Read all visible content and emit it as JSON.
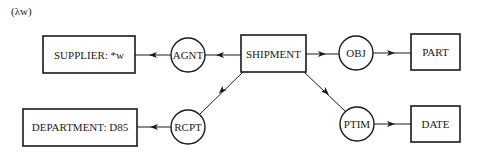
{
  "header": {
    "lambda_label": "(λw)"
  },
  "concepts": {
    "supplier": "SUPPLIER:  *w",
    "shipment": "SHIPMENT",
    "part": "PART",
    "department": "DEPARTMENT:  D85",
    "date": "DATE"
  },
  "relations": {
    "agnt": "AGNT",
    "obj": "OBJ",
    "rcpt": "RCPT",
    "ptim": "PTIM"
  },
  "colors": {
    "stroke": "#1a1a1a",
    "background": "#ffffff"
  }
}
